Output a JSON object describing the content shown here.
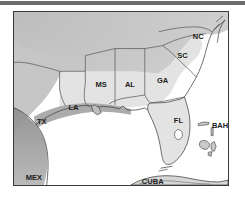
{
  "figure": {
    "type": "map",
    "region": "Southeastern United States and Gulf of Mexico",
    "projection_note": "unprojected outline map",
    "frame": {
      "border_color": "#3a3a3a"
    }
  },
  "colors": {
    "land_inland": "#c9c9c9",
    "land_states": "#e3e3e3",
    "coastal_shelf_band": "#9a9a9a",
    "water": "#ffffff",
    "outline": "#4a4a4a",
    "state_border": "#5a5a5a",
    "label_text": "#1c1c1c",
    "top_rule": "#6d6d6d",
    "frame": "#3a3a3a"
  },
  "labels": {
    "states": [
      {
        "code": "TX",
        "name": "Texas",
        "x": 28,
        "y": 113
      },
      {
        "code": "LA",
        "name": "Louisiana",
        "x": 60,
        "y": 99
      },
      {
        "code": "MS",
        "name": "Mississippi",
        "x": 88,
        "y": 76
      },
      {
        "code": "AL",
        "name": "Alabama",
        "x": 117,
        "y": 76
      },
      {
        "code": "GA",
        "name": "Georgia",
        "x": 150,
        "y": 72
      },
      {
        "code": "FL",
        "name": "Florida",
        "x": 166,
        "y": 112
      },
      {
        "code": "SC",
        "name": "South Carolina",
        "x": 170,
        "y": 47
      },
      {
        "code": "NC",
        "name": "North Carolina",
        "x": 186,
        "y": 27
      }
    ],
    "countries": [
      {
        "code": "MEX",
        "name": "Mexico",
        "x": 20,
        "y": 170
      },
      {
        "code": "CUBA",
        "name": "Cuba",
        "x": 140,
        "y": 174
      },
      {
        "code": "BAH",
        "name": "Bahamas",
        "x": 208,
        "y": 117
      }
    ]
  },
  "features": {
    "water_bodies": [
      "Gulf of Mexico",
      "Atlantic Ocean",
      "Lake Okeechobee"
    ],
    "landmasses": [
      "United States mainland",
      "Cuba",
      "Bahamas islands",
      "Florida Keys"
    ],
    "state_count": 8,
    "country_count": 3
  }
}
